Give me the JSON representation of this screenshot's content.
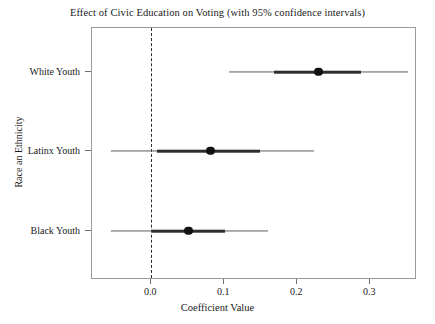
{
  "chart_data": {
    "type": "scatter",
    "title": "Effect of Civic Education on Voting (with 95% confidence intervals)",
    "xlabel": "Coefficient Value",
    "ylabel": "Race an Ethnicity",
    "categories": [
      "White Youth",
      "Latinx Youth",
      "Black Youth"
    ],
    "values": [
      0.229,
      0.081,
      0.051
    ],
    "ci_low": [
      0.107,
      -0.055,
      -0.055
    ],
    "ci_high": [
      0.352,
      0.223,
      0.16
    ],
    "inner_low": [
      0.168,
      0.008,
      0.001
    ],
    "inner_high": [
      0.288,
      0.149,
      0.101
    ],
    "xticks": [
      0.0,
      0.1,
      0.2,
      0.3
    ],
    "xtick_labels": [
      "0.0",
      "0.1",
      "0.2",
      "0.3"
    ],
    "xlim": [
      -0.081,
      0.364
    ],
    "reference_line": 0.0,
    "grid": false,
    "legend": null,
    "series": [
      {
        "name": "White Youth",
        "estimate": 0.229,
        "ci_low": 0.107,
        "ci_high": 0.352,
        "inner_low": 0.168,
        "inner_high": 0.288
      },
      {
        "name": "Latinx Youth",
        "estimate": 0.081,
        "ci_low": -0.055,
        "ci_high": 0.223,
        "inner_low": 0.008,
        "inner_high": 0.149
      },
      {
        "name": "Black Youth",
        "estimate": 0.051,
        "ci_low": -0.055,
        "ci_high": 0.16,
        "inner_low": 0.001,
        "inner_high": 0.101
      }
    ],
    "colors": {
      "dot": "#111111",
      "inner_interval": "#2e2e2e",
      "outer_interval": "#5c5c5c",
      "reference_line": "#2b2b2b",
      "frame": "#9a9a9a",
      "background": "#ffffff",
      "text": "#1a1a1a"
    }
  }
}
